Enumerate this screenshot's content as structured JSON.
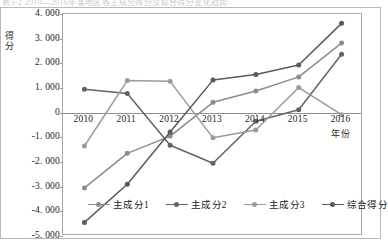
{
  "ghost_text_strip": "表5-2  2010—2016年某地区各主成分得分及综合得分变化趋势",
  "chart_data": {
    "type": "line",
    "title": "",
    "xlabel": "年份",
    "ylabel": "得分",
    "categories": [
      "2010",
      "2011",
      "2012",
      "2013",
      "2014",
      "2015",
      "2016"
    ],
    "x": [
      2010,
      2011,
      2012,
      2013,
      2014,
      2015,
      2016
    ],
    "ylim": [
      -5.0,
      4.0
    ],
    "yticks": [
      4.0,
      3.0,
      2.0,
      1.0,
      0,
      -1.0,
      -2.0,
      -3.0,
      -4.0,
      -5.0
    ],
    "ytick_labels": [
      "4. 000",
      "3. 000",
      "2. 000",
      "1. 000",
      "0",
      "-1. 000",
      "-2. 000",
      "-3. 000",
      "-4. 000",
      "-5. 000"
    ],
    "grid": false,
    "legend_position": "bottom",
    "markers": "circle",
    "series": [
      {
        "name": "主成分1",
        "color": "#8c8c90",
        "values": [
          -3.05,
          -1.65,
          -0.95,
          0.42,
          0.88,
          1.45,
          2.82
        ]
      },
      {
        "name": "主成分2",
        "color": "#636367",
        "values": [
          0.95,
          0.78,
          -1.32,
          -2.05,
          -0.35,
          0.12,
          2.37
        ]
      },
      {
        "name": "主成分3",
        "color": "#9b9b9f",
        "values": [
          -1.35,
          1.3,
          1.27,
          -1.02,
          -0.7,
          1.02,
          -0.08
        ]
      },
      {
        "name": "综合得分",
        "color": "#5a5a5e",
        "values": [
          -4.45,
          -2.9,
          -0.78,
          1.32,
          1.55,
          1.93,
          3.62
        ]
      }
    ]
  },
  "legend": {
    "items": [
      {
        "label": "主成分1"
      },
      {
        "label": "主成分2"
      },
      {
        "label": "主成分3"
      },
      {
        "label": "综合得分"
      }
    ]
  },
  "colors": {
    "frame": "#b9b9bd",
    "axis": "#a8a8ac",
    "zero_line": "#8e8e92",
    "text": "#1c1c1c"
  }
}
